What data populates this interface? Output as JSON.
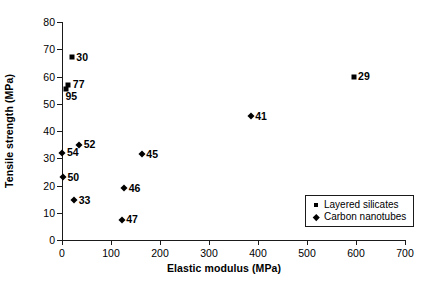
{
  "chart_data": {
    "type": "scatter",
    "title": "",
    "xlabel": "Elastic modulus (MPa)",
    "ylabel": "Tensile strength (MPa)",
    "xlim": [
      0,
      700
    ],
    "ylim": [
      0,
      80
    ],
    "xticks": [
      0,
      100,
      200,
      300,
      400,
      500,
      600,
      700
    ],
    "yticks": [
      0,
      10,
      20,
      30,
      40,
      50,
      60,
      70,
      80
    ],
    "grid": false,
    "legend_position": "bottom-right",
    "series": [
      {
        "name": "Layered silicates",
        "marker": "square",
        "color": "#000000",
        "points": [
          {
            "label": "30",
            "x": 20,
            "y": 67.0,
            "label_pos": "right"
          },
          {
            "label": "77",
            "x": 13,
            "y": 57.0,
            "label_pos": "right"
          },
          {
            "label": "95",
            "x": 8,
            "y": 55.5,
            "label_pos": "below"
          },
          {
            "label": "29",
            "x": 595,
            "y": 60.0,
            "label_pos": "right"
          }
        ]
      },
      {
        "name": "Carbon nanotubes",
        "marker": "diamond",
        "color": "#000000",
        "points": [
          {
            "label": "52",
            "x": 35,
            "y": 35.0,
            "label_pos": "right"
          },
          {
            "label": "54",
            "x": 1,
            "y": 32.0,
            "label_pos": "right"
          },
          {
            "label": "50",
            "x": 2,
            "y": 23.0,
            "label_pos": "right"
          },
          {
            "label": "33",
            "x": 25,
            "y": 14.5,
            "label_pos": "right"
          },
          {
            "label": "45",
            "x": 163,
            "y": 31.5,
            "label_pos": "right"
          },
          {
            "label": "46",
            "x": 127,
            "y": 19.0,
            "label_pos": "right"
          },
          {
            "label": "47",
            "x": 122,
            "y": 7.5,
            "label_pos": "right"
          },
          {
            "label": "41",
            "x": 385,
            "y": 45.5,
            "label_pos": "right"
          }
        ]
      }
    ]
  }
}
